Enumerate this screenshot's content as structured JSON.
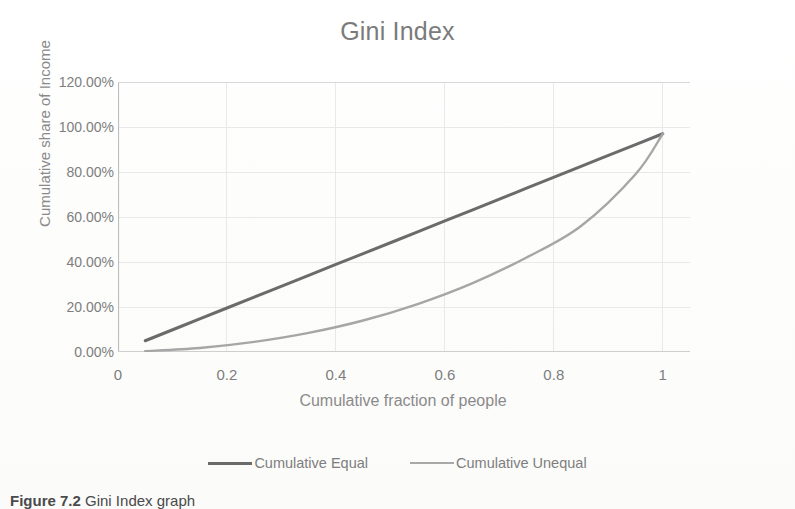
{
  "chart_data": {
    "type": "line",
    "title": "Gini Index",
    "xlabel": "Cumulative fraction of people",
    "ylabel": "Cumulative share of Income",
    "xlim": [
      0,
      1.05
    ],
    "ylim": [
      0,
      1.2
    ],
    "grid": true,
    "legend_position": "bottom",
    "xticks": [
      "0",
      "0.2",
      "0.4",
      "0.6",
      "0.8",
      "1"
    ],
    "xtick_values": [
      0,
      0.2,
      0.4,
      0.6,
      0.8,
      1
    ],
    "yticks": [
      "0.00%",
      "20.00%",
      "40.00%",
      "60.00%",
      "80.00%",
      "100.00%",
      "120.00%"
    ],
    "ytick_values": [
      0,
      0.2,
      0.4,
      0.6,
      0.8,
      1.0,
      1.2
    ],
    "x": [
      0.05,
      0.15,
      0.25,
      0.35,
      0.45,
      0.55,
      0.65,
      0.75,
      0.85,
      0.95,
      1.0
    ],
    "series": [
      {
        "name": "Cumulative  Equal",
        "color": "#6b6b6b",
        "width": 3.0,
        "values": [
          0.05,
          0.147,
          0.244,
          0.341,
          0.437,
          0.534,
          0.631,
          0.728,
          0.825,
          0.922,
          0.97
        ]
      },
      {
        "name": "Cumulative  Unequal",
        "color": "#a6a6a6",
        "width": 2.4,
        "values": [
          0.004,
          0.018,
          0.045,
          0.085,
          0.14,
          0.213,
          0.305,
          0.42,
          0.56,
          0.79,
          0.97
        ]
      }
    ]
  },
  "chart": {
    "title": "Gini Index",
    "x_axis_title": "Cumulative fraction of people",
    "y_axis_title": "Cumulative share of Income"
  },
  "legend": {
    "entries": [
      {
        "label": "Cumulative  Equal",
        "color": "#6b6b6b",
        "thickness": "3px"
      },
      {
        "label": "Cumulative  Unequal",
        "color": "#a8a8a8",
        "thickness": "2px"
      }
    ]
  },
  "caption": {
    "prefix": "Figure 7.2",
    "text": "Gini Index graph"
  },
  "style": {
    "text_color": "#7e7e7e",
    "title_color": "#7b7b7b",
    "grid_color": "#e9e9e9",
    "axis_color": "#d8d8d8",
    "background": "#ffffff"
  }
}
